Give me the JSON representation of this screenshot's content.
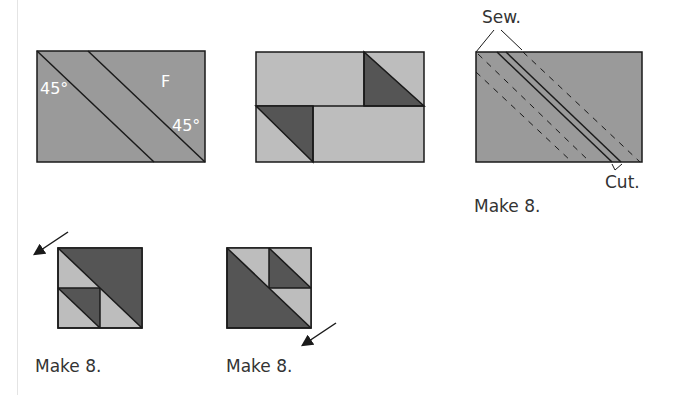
{
  "colors": {
    "medium_gray": "#9a9a9a",
    "light_gray": "#bdbdbd",
    "dark_gray": "#555555",
    "stroke": "#1a1a1a",
    "label_white": "#ffffff",
    "text": "#333333"
  },
  "panel_1": {
    "angle_left": "45°",
    "angle_right": "45°",
    "fabric_label": "F"
  },
  "panel_3": {
    "sew_label": "Sew.",
    "cut_label": "Cut.",
    "make_label": "Make 8."
  },
  "panel_4": {
    "make_label": "Make 8.",
    "arrow": "arrow-up-left"
  },
  "panel_5": {
    "make_label": "Make 8.",
    "arrow": "arrow-down-left"
  }
}
